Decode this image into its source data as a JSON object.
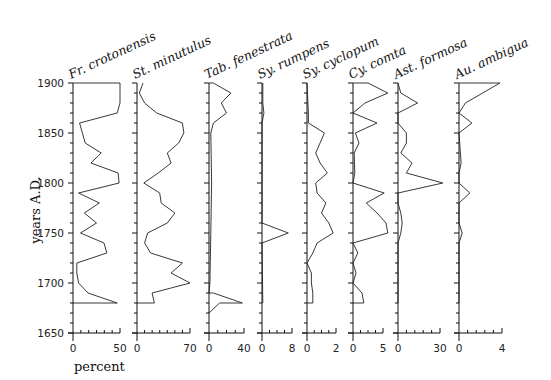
{
  "chart_data": {
    "type": "line",
    "title": "",
    "ylabel": "years A.D.",
    "xlabel": "percent",
    "ylim": [
      1650,
      1900
    ],
    "yticks": [
      1650,
      1700,
      1750,
      1800,
      1850,
      1900
    ],
    "y_minor_tick_step": 10,
    "grid": false,
    "orientation": "stratigraphic (depth/time on y-axis, abundance on x-axis)",
    "series": [
      {
        "name": "Fr. crotonensis",
        "xlim": [
          0,
          50
        ],
        "xticks": [
          0,
          50
        ],
        "points": [
          [
            1900,
            0
          ],
          [
            1900,
            50
          ],
          [
            1880,
            50
          ],
          [
            1870,
            47
          ],
          [
            1860,
            7
          ],
          [
            1840,
            13
          ],
          [
            1830,
            30
          ],
          [
            1820,
            19
          ],
          [
            1810,
            48
          ],
          [
            1800,
            49
          ],
          [
            1790,
            6
          ],
          [
            1780,
            28
          ],
          [
            1770,
            12
          ],
          [
            1760,
            25
          ],
          [
            1750,
            8
          ],
          [
            1740,
            33
          ],
          [
            1730,
            36
          ],
          [
            1720,
            4
          ],
          [
            1710,
            4
          ],
          [
            1700,
            6
          ],
          [
            1690,
            16
          ],
          [
            1680,
            47
          ],
          [
            1680,
            0
          ]
        ]
      },
      {
        "name": "St. minutulus",
        "xlim": [
          0,
          70
        ],
        "xticks": [
          0,
          70
        ],
        "points": [
          [
            1900,
            8
          ],
          [
            1890,
            3
          ],
          [
            1880,
            10
          ],
          [
            1870,
            26
          ],
          [
            1860,
            60
          ],
          [
            1850,
            62
          ],
          [
            1840,
            55
          ],
          [
            1830,
            40
          ],
          [
            1820,
            45
          ],
          [
            1810,
            28
          ],
          [
            1800,
            9
          ],
          [
            1790,
            30
          ],
          [
            1780,
            32
          ],
          [
            1770,
            50
          ],
          [
            1760,
            40
          ],
          [
            1750,
            14
          ],
          [
            1740,
            10
          ],
          [
            1730,
            18
          ],
          [
            1720,
            60
          ],
          [
            1710,
            45
          ],
          [
            1700,
            70
          ],
          [
            1690,
            20
          ],
          [
            1680,
            23
          ],
          [
            1680,
            0
          ]
        ]
      },
      {
        "name": "Tab. fenestrata",
        "xlim": [
          0,
          40
        ],
        "xticks": [
          0,
          40
        ],
        "points": [
          [
            1900,
            0
          ],
          [
            1900,
            5
          ],
          [
            1890,
            25
          ],
          [
            1880,
            14
          ],
          [
            1870,
            20
          ],
          [
            1860,
            5
          ],
          [
            1850,
            2
          ],
          [
            1800,
            3
          ],
          [
            1750,
            2
          ],
          [
            1700,
            1
          ],
          [
            1690,
            0
          ],
          [
            1690,
            5
          ],
          [
            1680,
            38
          ],
          [
            1680,
            12
          ],
          [
            1670,
            0
          ]
        ]
      },
      {
        "name": "Sy. rumpens",
        "xlim": [
          0,
          8
        ],
        "xticks": [
          0,
          8
        ],
        "points": [
          [
            1900,
            0.2
          ],
          [
            1880,
            0.2
          ],
          [
            1870,
            0.5
          ],
          [
            1860,
            0
          ],
          [
            1760,
            0
          ],
          [
            1750,
            7
          ],
          [
            1740,
            0
          ],
          [
            1680,
            0.2
          ]
        ]
      },
      {
        "name": "Sy. cyclopum",
        "xlim": [
          0,
          2
        ],
        "xticks": [
          0,
          2
        ],
        "points": [
          [
            1900,
            0
          ],
          [
            1870,
            0.1
          ],
          [
            1860,
            0.1
          ],
          [
            1850,
            1.2
          ],
          [
            1830,
            0.6
          ],
          [
            1820,
            0.9
          ],
          [
            1810,
            1.4
          ],
          [
            1800,
            0.6
          ],
          [
            1790,
            0.7
          ],
          [
            1780,
            1.3
          ],
          [
            1770,
            1.0
          ],
          [
            1760,
            1.5
          ],
          [
            1750,
            1.8
          ],
          [
            1740,
            0.7
          ],
          [
            1730,
            0.4
          ],
          [
            1720,
            0
          ],
          [
            1710,
            0.3
          ],
          [
            1700,
            0.3
          ],
          [
            1690,
            0.4
          ],
          [
            1680,
            0.4
          ],
          [
            1680,
            0
          ]
        ]
      },
      {
        "name": "Cy. comta",
        "xlim": [
          0,
          5
        ],
        "xticks": [
          0,
          5
        ],
        "points": [
          [
            1900,
            0
          ],
          [
            1900,
            2.5
          ],
          [
            1890,
            5.8
          ],
          [
            1880,
            2.0
          ],
          [
            1870,
            0
          ],
          [
            1860,
            4.0
          ],
          [
            1850,
            0.4
          ],
          [
            1840,
            1.0
          ],
          [
            1830,
            0.2
          ],
          [
            1810,
            0.3
          ],
          [
            1800,
            0
          ],
          [
            1790,
            5.2
          ],
          [
            1780,
            2.2
          ],
          [
            1770,
            4.0
          ],
          [
            1760,
            5.5
          ],
          [
            1750,
            5.8
          ],
          [
            1740,
            0
          ],
          [
            1730,
            0.8
          ],
          [
            1720,
            0
          ],
          [
            1710,
            0.5
          ],
          [
            1700,
            0
          ],
          [
            1690,
            1.5
          ],
          [
            1680,
            1.8
          ],
          [
            1680,
            0
          ]
        ]
      },
      {
        "name": "Ast. formosa",
        "xlim": [
          0,
          30
        ],
        "xticks": [
          0,
          30
        ],
        "points": [
          [
            1900,
            0
          ],
          [
            1890,
            2
          ],
          [
            1880,
            14
          ],
          [
            1870,
            0
          ],
          [
            1860,
            0
          ],
          [
            1850,
            6
          ],
          [
            1840,
            6
          ],
          [
            1830,
            2
          ],
          [
            1820,
            10
          ],
          [
            1810,
            6
          ],
          [
            1800,
            32
          ],
          [
            1790,
            0
          ],
          [
            1780,
            0
          ],
          [
            1770,
            2
          ],
          [
            1760,
            3
          ],
          [
            1750,
            2
          ],
          [
            1740,
            0
          ],
          [
            1680,
            0
          ]
        ]
      },
      {
        "name": "Au. ambigua",
        "xlim": [
          0,
          4
        ],
        "xticks": [
          0,
          4
        ],
        "points": [
          [
            1900,
            0
          ],
          [
            1900,
            3.8
          ],
          [
            1880,
            0.6
          ],
          [
            1870,
            0
          ],
          [
            1860,
            1.2
          ],
          [
            1850,
            0
          ],
          [
            1820,
            0.2
          ],
          [
            1810,
            0
          ],
          [
            1800,
            0
          ],
          [
            1790,
            1.0
          ],
          [
            1780,
            0
          ],
          [
            1760,
            0
          ],
          [
            1750,
            0.3
          ],
          [
            1740,
            0
          ],
          [
            1680,
            0
          ]
        ]
      }
    ]
  },
  "labels": {
    "ylabel": "years A.D.",
    "xlabel": "percent"
  }
}
